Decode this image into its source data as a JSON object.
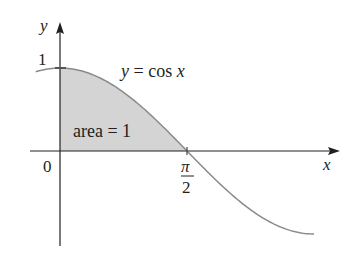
{
  "chart_data": {
    "type": "area",
    "title": "",
    "function_label": "y = cos x",
    "area_label": "area = 1",
    "xlabel": "x",
    "ylabel": "y",
    "x_ticks": [
      {
        "value": 0,
        "label": "0"
      },
      {
        "value": 1.5708,
        "label_numerator": "π",
        "label_denominator": "2"
      }
    ],
    "y_ticks": [
      {
        "value": 1,
        "label": "1"
      }
    ],
    "xlim": [
      -0.3,
      3.15
    ],
    "ylim": [
      -1.1,
      1.15
    ],
    "shaded_region": {
      "from": 0,
      "to": 1.5708,
      "area": 1
    },
    "series": [
      {
        "name": "y = cos x",
        "x": [
          -0.3,
          0,
          0.5,
          1.0,
          1.5708,
          2.0,
          2.5,
          3.0,
          3.1416
        ],
        "values": [
          0.955,
          1,
          0.878,
          0.54,
          0,
          -0.416,
          -0.801,
          -0.99,
          -1
        ]
      }
    ],
    "grid": false,
    "legend": "none",
    "colors": {
      "curve": "#8a8a8a",
      "fill": "#d4d4d4",
      "axis": "#231f20"
    }
  },
  "labels": {
    "y_axis": "y",
    "x_axis": "x",
    "y_one": "1",
    "origin": "0",
    "pi": "π",
    "two": "2",
    "func_y": "y",
    "func_eq": " = cos ",
    "func_x": "x",
    "area_text": "area = 1"
  }
}
